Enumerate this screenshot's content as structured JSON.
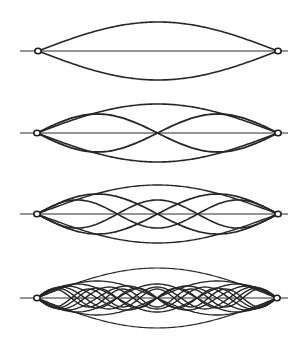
{
  "colors": {
    "ink": "#262626",
    "background": "#ffffff"
  },
  "panels": [
    {
      "id": "fundamental",
      "axis_y": 51,
      "x_start": 38,
      "x_end": 278,
      "line_start": 20,
      "line_end": 288,
      "harmonics": [
        {
          "n": 1,
          "amplitude": 29,
          "stroke": 1.6
        }
      ]
    },
    {
      "id": "harmonics-1-2",
      "axis_y": 133,
      "x_start": 37,
      "x_end": 278,
      "line_start": 20,
      "line_end": 288,
      "harmonics": [
        {
          "n": 1,
          "amplitude": 29,
          "stroke": 1.6
        },
        {
          "n": 2,
          "amplitude": 19,
          "stroke": 1.8
        }
      ]
    },
    {
      "id": "harmonics-1-3",
      "axis_y": 214,
      "x_start": 37,
      "x_end": 278,
      "line_start": 20,
      "line_end": 288,
      "harmonics": [
        {
          "n": 1,
          "amplitude": 29,
          "stroke": 1.4
        },
        {
          "n": 2,
          "amplitude": 20,
          "stroke": 1.7
        },
        {
          "n": 3,
          "amplitude": 14,
          "stroke": 1.6
        }
      ]
    },
    {
      "id": "harmonics-1-7",
      "axis_y": 298,
      "x_start": 37,
      "x_end": 277,
      "line_start": 20,
      "line_end": 288,
      "harmonics": [
        {
          "n": 1,
          "amplitude": 30,
          "stroke": 1.2
        },
        {
          "n": 2,
          "amplitude": 17,
          "stroke": 1.3
        },
        {
          "n": 3,
          "amplitude": 14,
          "stroke": 1.4
        },
        {
          "n": 4,
          "amplitude": 12,
          "stroke": 1.4
        },
        {
          "n": 5,
          "amplitude": 11,
          "stroke": 1.4
        },
        {
          "n": 6,
          "amplitude": 10,
          "stroke": 1.4
        },
        {
          "n": 7,
          "amplitude": 9,
          "stroke": 1.4
        }
      ]
    }
  ]
}
